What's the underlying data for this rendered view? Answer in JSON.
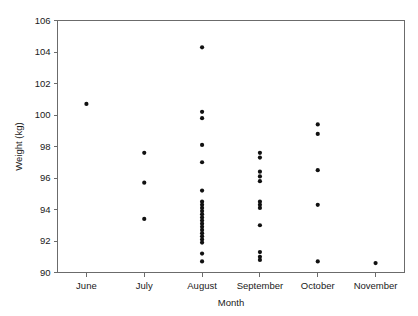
{
  "chart_data": {
    "type": "scatter",
    "title": "",
    "xlabel": "Month",
    "ylabel": "Weight (kg)",
    "categories": [
      "June",
      "July",
      "August",
      "September",
      "October",
      "November"
    ],
    "xtick_labels": [
      "June",
      "July",
      "August",
      "September",
      "October",
      "November"
    ],
    "ytick_labels": [
      "90",
      "92",
      "94",
      "96",
      "98",
      "100",
      "102",
      "104",
      "106"
    ],
    "ytick_values": [
      90,
      92,
      94,
      96,
      98,
      100,
      102,
      104,
      106
    ],
    "ylim": [
      90,
      106
    ],
    "grid": false,
    "legend": null,
    "marker": "filled-circle",
    "marker_color": "#111111",
    "frame": true,
    "series": [
      {
        "name": "Weight",
        "points": [
          {
            "category": "June",
            "y": 100.7
          },
          {
            "category": "July",
            "y": 97.6
          },
          {
            "category": "July",
            "y": 95.7
          },
          {
            "category": "July",
            "y": 93.4
          },
          {
            "category": "August",
            "y": 104.3
          },
          {
            "category": "August",
            "y": 100.2
          },
          {
            "category": "August",
            "y": 99.8
          },
          {
            "category": "August",
            "y": 98.1
          },
          {
            "category": "August",
            "y": 97.0
          },
          {
            "category": "August",
            "y": 95.2
          },
          {
            "category": "August",
            "y": 94.5
          },
          {
            "category": "August",
            "y": 94.3
          },
          {
            "category": "August",
            "y": 94.1
          },
          {
            "category": "August",
            "y": 93.9
          },
          {
            "category": "August",
            "y": 93.7
          },
          {
            "category": "August",
            "y": 93.5
          },
          {
            "category": "August",
            "y": 93.3
          },
          {
            "category": "August",
            "y": 93.1
          },
          {
            "category": "August",
            "y": 92.9
          },
          {
            "category": "August",
            "y": 92.7
          },
          {
            "category": "August",
            "y": 92.5
          },
          {
            "category": "August",
            "y": 92.3
          },
          {
            "category": "August",
            "y": 92.1
          },
          {
            "category": "August",
            "y": 91.9
          },
          {
            "category": "August",
            "y": 91.2
          },
          {
            "category": "August",
            "y": 90.7
          },
          {
            "category": "September",
            "y": 97.6
          },
          {
            "category": "September",
            "y": 97.3
          },
          {
            "category": "September",
            "y": 96.4
          },
          {
            "category": "September",
            "y": 96.1
          },
          {
            "category": "September",
            "y": 95.8
          },
          {
            "category": "September",
            "y": 94.5
          },
          {
            "category": "September",
            "y": 94.3
          },
          {
            "category": "September",
            "y": 94.1
          },
          {
            "category": "September",
            "y": 93.0
          },
          {
            "category": "September",
            "y": 91.3
          },
          {
            "category": "September",
            "y": 91.0
          },
          {
            "category": "September",
            "y": 90.8
          },
          {
            "category": "October",
            "y": 99.4
          },
          {
            "category": "October",
            "y": 98.8
          },
          {
            "category": "October",
            "y": 96.5
          },
          {
            "category": "October",
            "y": 94.3
          },
          {
            "category": "October",
            "y": 90.7
          },
          {
            "category": "November",
            "y": 90.6
          }
        ]
      }
    ]
  }
}
